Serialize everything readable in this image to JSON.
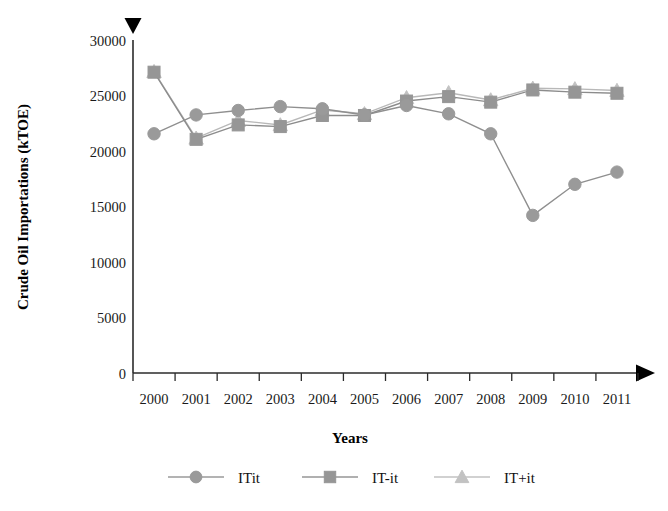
{
  "chart_data": {
    "type": "line",
    "title": "",
    "xlabel": "Years",
    "ylabel": "Crude Oil Importations (kTOE)",
    "categories": [
      "2000",
      "2001",
      "2002",
      "2003",
      "2004",
      "2005",
      "2006",
      "2007",
      "2008",
      "2009",
      "2010",
      "2011"
    ],
    "x": [
      2000,
      2001,
      2002,
      2003,
      2004,
      2005,
      2006,
      2007,
      2008,
      2009,
      2010,
      2011
    ],
    "ylim": [
      0,
      30000
    ],
    "yticks": [
      0,
      5000,
      10000,
      15000,
      20000,
      25000,
      30000
    ],
    "ytick_labels": [
      "0",
      "5000",
      "10000",
      "15000",
      "20000",
      "25000",
      "30000"
    ],
    "grid": false,
    "legend_position": "bottom",
    "series": [
      {
        "name": "ITit",
        "marker": "circle",
        "color": "#9a9a9a",
        "line_color": "#8f8f8f",
        "values": [
          21550,
          23250,
          23650,
          24000,
          23800,
          23250,
          24100,
          23350,
          21550,
          14200,
          17000,
          18100
        ]
      },
      {
        "name": "IT-it",
        "marker": "square",
        "color": "#969696",
        "line_color": "#8c8c8c",
        "values": [
          27100,
          21050,
          22350,
          22200,
          23200,
          23200,
          24500,
          24900,
          24400,
          25500,
          25300,
          25200
        ]
      },
      {
        "name": "IT+it",
        "marker": "triangle",
        "color": "#c2c2c2",
        "line_color": "#b8b8b8",
        "values": [
          27150,
          21150,
          22750,
          22350,
          23700,
          23350,
          24800,
          25250,
          24600,
          25650,
          25600,
          25450
        ]
      }
    ]
  },
  "axis": {
    "y_arrow": "up-arrow-marker",
    "x_arrow": "right-arrow-marker"
  },
  "legend": {
    "items": [
      {
        "label": "ITit",
        "marker": "circle-marker",
        "color": "#9a9a9a"
      },
      {
        "label": "IT-it",
        "marker": "square-marker",
        "color": "#969696"
      },
      {
        "label": "IT+it",
        "marker": "triangle-marker",
        "color": "#c2c2c2"
      }
    ]
  }
}
